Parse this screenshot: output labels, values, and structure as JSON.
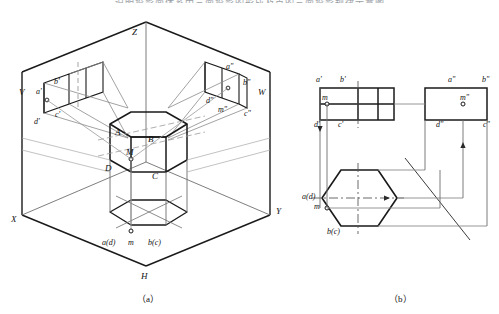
{
  "figure": {
    "kind": "descriptive-geometry-projection-drawing",
    "top_cut_text": "说明投影面体系中三面投影的形成及点的三面投影规律示意图",
    "captions": {
      "left": "（a）",
      "right": "（b）"
    }
  },
  "diagram_a": {
    "name": "three-projection-plane-box-with-hex-prism",
    "axes": [
      {
        "id": "z-axis",
        "label": "Z"
      },
      {
        "id": "x-axis",
        "label": "X"
      },
      {
        "id": "y-axis",
        "label": "Y"
      }
    ],
    "planes": [
      {
        "id": "v-plane",
        "label": "V"
      },
      {
        "id": "w-plane",
        "label": "W"
      },
      {
        "id": "h-plane",
        "label": "H"
      }
    ],
    "solid_labels": [
      {
        "id": "vertex-A",
        "label": "A"
      },
      {
        "id": "vertex-B",
        "label": "B"
      },
      {
        "id": "vertex-C",
        "label": "C"
      },
      {
        "id": "vertex-D",
        "label": "D"
      },
      {
        "id": "point-M",
        "label": "M"
      }
    ],
    "v_projection_labels": [
      {
        "id": "a-prime",
        "label": "a'"
      },
      {
        "id": "b-prime",
        "label": "b'"
      },
      {
        "id": "c-prime",
        "label": "c'"
      },
      {
        "id": "d-prime",
        "label": "d'"
      }
    ],
    "w_projection_labels": [
      {
        "id": "a-dprime",
        "label": "a\""
      },
      {
        "id": "b-dprime",
        "label": "b\""
      },
      {
        "id": "c-dprime",
        "label": "c\""
      },
      {
        "id": "d-dprime",
        "label": "d\""
      },
      {
        "id": "m-dprime",
        "label": "m\""
      }
    ],
    "h_projection_labels": [
      {
        "id": "ad-pair",
        "label": "a(d)"
      },
      {
        "id": "m-h",
        "label": "m"
      },
      {
        "id": "bc-pair",
        "label": "b(c)"
      }
    ]
  },
  "diagram_b": {
    "name": "unfolded-three-view-orthographic",
    "front_view": {
      "id": "front-view",
      "labels": [
        {
          "id": "a-prime",
          "label": "a'"
        },
        {
          "id": "b-prime",
          "label": "b'"
        },
        {
          "id": "c-prime",
          "label": "c'"
        },
        {
          "id": "d-prime",
          "label": "d'"
        },
        {
          "id": "m-prime",
          "label": "m"
        }
      ]
    },
    "side_view": {
      "id": "side-view",
      "labels": [
        {
          "id": "a-dprime",
          "label": "a\""
        },
        {
          "id": "b-dprime",
          "label": "b\""
        },
        {
          "id": "c-dprime",
          "label": "c\""
        },
        {
          "id": "d-dprime",
          "label": "d\""
        },
        {
          "id": "m-dprime",
          "label": "m\""
        }
      ]
    },
    "top_view": {
      "id": "top-view",
      "shape": "hexagon",
      "labels": [
        {
          "id": "ad-pair",
          "label": "a(d)"
        },
        {
          "id": "m-h",
          "label": "m"
        },
        {
          "id": "bc-pair",
          "label": "b(c)"
        }
      ]
    }
  },
  "style": {
    "stroke_dark": "#1a1a1a",
    "stroke_light": "#8a8a8a",
    "background": "#ffffff"
  }
}
